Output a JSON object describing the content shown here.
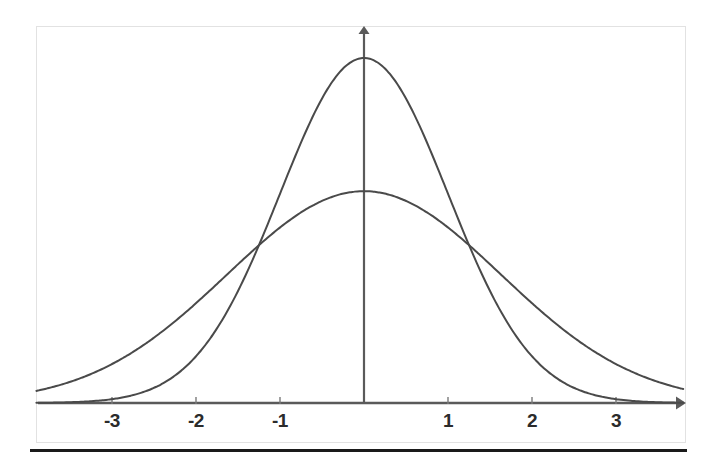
{
  "figure": {
    "name": "normal-distribution-comparison",
    "background_color": "#ffffff",
    "frame_color": "#e2e2e2",
    "baseline_rule_color": "#1a1a1a"
  },
  "chart_data": {
    "type": "line",
    "title": "",
    "subtitle": "",
    "xlabel": "",
    "ylabel": "",
    "xlim": [
      -3.9,
      3.8
    ],
    "ylim": [
      0,
      0.46
    ],
    "grid": false,
    "legend": false,
    "legend_position": "none",
    "axis_style": {
      "x_axis": "arrow-right",
      "y_axis": "arrow-up",
      "axis_color": "#5a5a5a",
      "y_axis_x_value": 0
    },
    "x_ticks": [
      -3,
      -2,
      -1,
      1,
      2,
      3
    ],
    "x_tick_labels": [
      "-3",
      "-2",
      "-1",
      "1",
      "2",
      "3"
    ],
    "y_ticks": [],
    "y_tick_labels": [],
    "annotations": [],
    "series": [
      {
        "name": "narrow normal curve",
        "color": "#4a4a4a",
        "line_width": 2,
        "mean": 0,
        "sigma": 1,
        "peak_value": 0.399,
        "x": [
          -3.9,
          -3.6,
          -3.3,
          -3.0,
          -2.7,
          -2.4,
          -2.1,
          -1.8,
          -1.5,
          -1.2,
          -0.9,
          -0.6,
          -0.3,
          0.0,
          0.3,
          0.6,
          0.9,
          1.2,
          1.5,
          1.8,
          2.1,
          2.4,
          2.7,
          3.0,
          3.3,
          3.6,
          3.8
        ],
        "values": [
          0.0002,
          0.0006,
          0.0017,
          0.0044,
          0.0104,
          0.0224,
          0.044,
          0.079,
          0.1295,
          0.1942,
          0.2661,
          0.3332,
          0.3814,
          0.3989,
          0.3814,
          0.3332,
          0.2661,
          0.1942,
          0.1295,
          0.079,
          0.044,
          0.0224,
          0.0104,
          0.0044,
          0.0017,
          0.0006,
          0.0003
        ]
      },
      {
        "name": "wide normal curve",
        "color": "#4a4a4a",
        "line_width": 2,
        "mean": 0,
        "sigma": 1.63,
        "peak_value": 0.245,
        "x": [
          -3.9,
          -3.6,
          -3.3,
          -3.0,
          -2.7,
          -2.4,
          -2.1,
          -1.8,
          -1.5,
          -1.2,
          -0.9,
          -0.6,
          -0.3,
          0.0,
          0.3,
          0.6,
          0.9,
          1.2,
          1.5,
          1.8,
          2.1,
          2.4,
          2.7,
          3.0,
          3.3,
          3.6,
          3.8
        ],
        "values": [
          0.0067,
          0.0113,
          0.0182,
          0.0281,
          0.0417,
          0.0594,
          0.0812,
          0.1067,
          0.1346,
          0.1632,
          0.19,
          0.2124,
          0.2281,
          0.2337,
          0.2281,
          0.2124,
          0.19,
          0.1632,
          0.1346,
          0.1067,
          0.0812,
          0.0594,
          0.0417,
          0.0281,
          0.0182,
          0.0113,
          0.0076
        ]
      }
    ],
    "intersections": [
      {
        "x": -1.18,
        "y": 0.198
      },
      {
        "x": 1.18,
        "y": 0.198
      }
    ]
  }
}
